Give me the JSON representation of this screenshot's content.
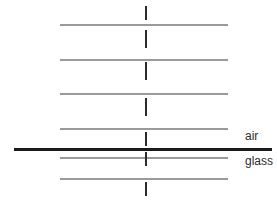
{
  "figure": {
    "kind": "wavefront-refraction-diagram",
    "background_color": "#ffffff",
    "width": 277,
    "height": 202,
    "wavefront_color": "#9a9a9a",
    "ray_color": "#2b2b2b",
    "interface_color": "#1a1a1a"
  },
  "labels": {
    "air": "air",
    "glass": "glass"
  },
  "interface": {
    "y": 148,
    "x_start": 14,
    "x_end": 272,
    "thickness": 3
  },
  "wavefronts": [
    {
      "y": 24,
      "x_start": 60,
      "x_end": 228,
      "medium": "air"
    },
    {
      "y": 59,
      "x_start": 60,
      "x_end": 228,
      "medium": "air"
    },
    {
      "y": 93,
      "x_start": 60,
      "x_end": 228,
      "medium": "air"
    },
    {
      "y": 128,
      "x_start": 60,
      "x_end": 228,
      "medium": "air"
    },
    {
      "y": 157,
      "x_start": 60,
      "x_end": 228,
      "medium": "glass"
    },
    {
      "y": 178,
      "x_start": 60,
      "x_end": 228,
      "medium": "glass"
    }
  ],
  "ray_ticks": [
    {
      "x": 145,
      "y_start": 6,
      "y_end": 20
    },
    {
      "x": 145,
      "y_start": 30,
      "y_end": 48
    },
    {
      "x": 145,
      "y_start": 62,
      "y_end": 80
    },
    {
      "x": 145,
      "y_start": 98,
      "y_end": 116
    },
    {
      "x": 145,
      "y_start": 132,
      "y_end": 146
    },
    {
      "x": 145,
      "y_start": 152,
      "y_end": 166
    },
    {
      "x": 145,
      "y_start": 182,
      "y_end": 196
    }
  ],
  "label_positions": {
    "air": {
      "x": 245,
      "y": 130
    },
    "glass": {
      "x": 245,
      "y": 155
    }
  }
}
